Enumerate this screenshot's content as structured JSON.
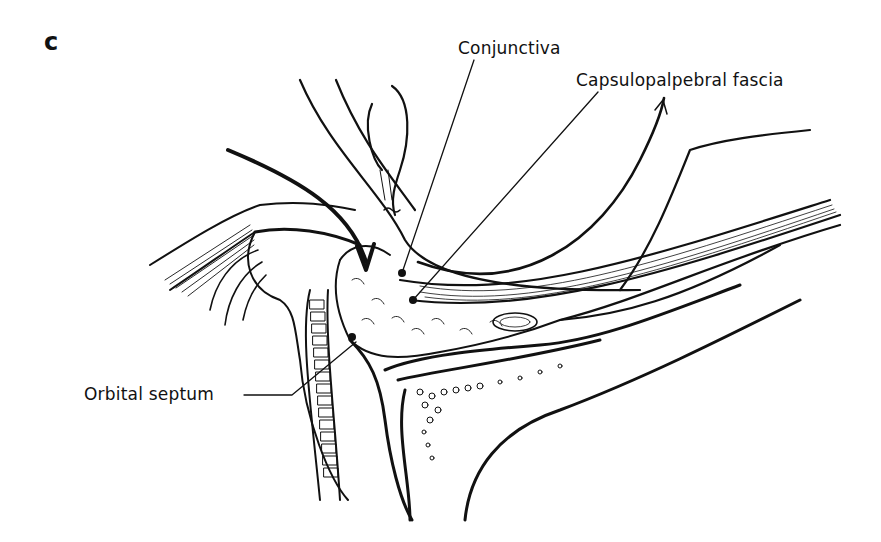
{
  "figure": {
    "panel_letter": "c",
    "labels": {
      "conjunctiva": "Conjunctiva",
      "capsulopalpebral_fascia": "Capsulopalpebral fascia",
      "orbital_septum": "Orbital septum"
    },
    "colors": {
      "ink": "#111111",
      "background": "#ffffff"
    }
  }
}
